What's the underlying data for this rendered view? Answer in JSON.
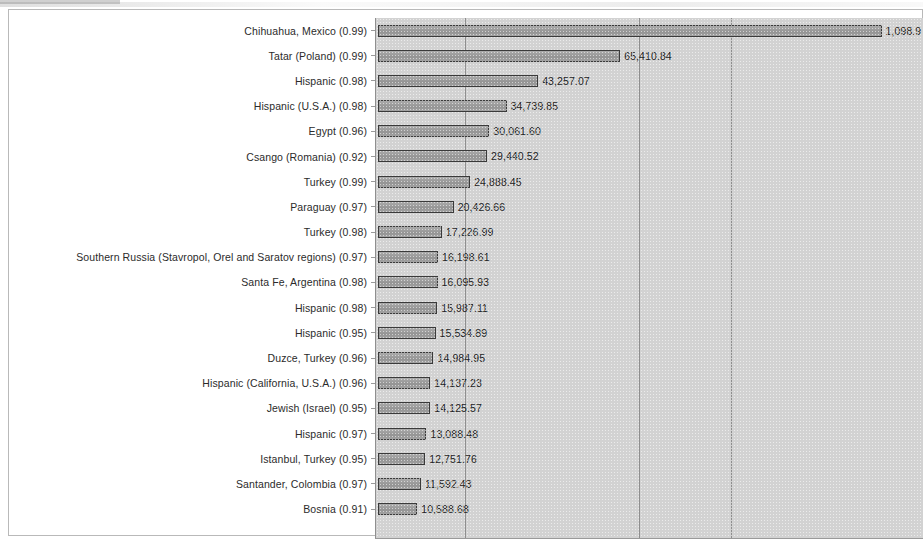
{
  "chart_data": {
    "type": "bar",
    "orientation": "horizontal",
    "title": "",
    "subtitle": "",
    "xlabel": "",
    "ylabel": "",
    "grid": true,
    "gridlines_x": [
      24000,
      71000,
      96000
    ],
    "xlim": [
      0,
      148000
    ],
    "legend": "none",
    "note": "Top bar value is clipped at the right edge of the image",
    "categories": [
      "Chihuahua, Mexico (0.99)",
      "Tatar (Poland) (0.99)",
      "Hispanic (0.98)",
      "Hispanic (U.S.A.) (0.98)",
      "Egypt (0.96)",
      "Csango (Romania) (0.92)",
      "Turkey (0.99)",
      "Paraguay (0.97)",
      "Turkey (0.98)",
      "Southern Russia (Stavropol, Orel and Saratov regions) (0.97)",
      "Santa Fe, Argentina (0.98)",
      "Hispanic (0.98)",
      "Hispanic (0.95)",
      "Duzce, Turkey (0.96)",
      "Hispanic (California, U.S.A.) (0.96)",
      "Jewish (Israel) (0.95)",
      "Hispanic (0.97)",
      "Istanbul, Turkey (0.95)",
      "Santander, Colombia (0.97)",
      "Bosnia (0.91)"
    ],
    "values": [
      136000,
      65410.84,
      43257.07,
      34739.85,
      30061.6,
      29440.52,
      24888.45,
      20426.66,
      17226.99,
      16198.61,
      16095.93,
      15987.11,
      15534.89,
      14984.95,
      14137.23,
      14125.57,
      13088.48,
      12751.76,
      11592.43,
      10588.68
    ],
    "value_labels": [
      "1,098.9",
      "65,410.84",
      "43,257.07",
      "34,739.85",
      "30,061.60",
      "29,440.52",
      "24,888.45",
      "20,426.66",
      "17,226.99",
      "16,198.61",
      "16,095.93",
      "15,987.11",
      "15,534.89",
      "14,984.95",
      "14,137.23",
      "14,125.57",
      "13,088.48",
      "12,751.76",
      "11,592.43",
      "10,588.68"
    ]
  },
  "colors": {
    "bar_fill": "#9d9d9d",
    "bar_border": "#3a3a3a",
    "plot_background": "#d2d2d2",
    "gridline": "#8e8e8e",
    "text": "#2b2b2b",
    "page_background": "#ffffff",
    "frame_border": "#b9b9b9"
  }
}
